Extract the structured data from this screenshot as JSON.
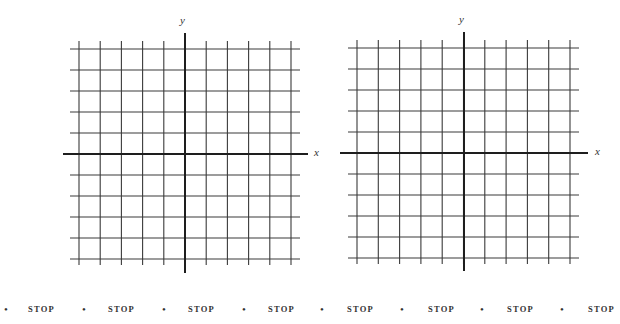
{
  "grids": [
    {
      "name": "left-grid",
      "x_label": "x",
      "y_label": "y",
      "cells_x": 10,
      "cells_y": 10
    },
    {
      "name": "right-grid",
      "x_label": "x",
      "y_label": "y",
      "cells_x": 10,
      "cells_y": 10
    }
  ],
  "stop_row": {
    "bullet": "•",
    "items": [
      "STOP",
      "STOP",
      "STOP",
      "STOP",
      "STOP",
      "STOP",
      "STOP",
      "STOP"
    ]
  },
  "colors": {
    "grid_line": "#3a3a3a",
    "axis_line": "#1e1e1e",
    "text": "#333333"
  }
}
